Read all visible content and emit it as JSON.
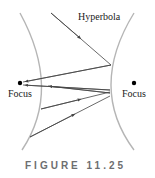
{
  "figure": {
    "title_label": "Hyperbola",
    "left_focus_label": "Focus",
    "right_focus_label": "Focus",
    "caption": "FIGURE 11.25"
  },
  "colors": {
    "curve": "#b5b5b5",
    "ray": "#444444",
    "focus": "#000000",
    "caption": "#6d6e70"
  }
}
